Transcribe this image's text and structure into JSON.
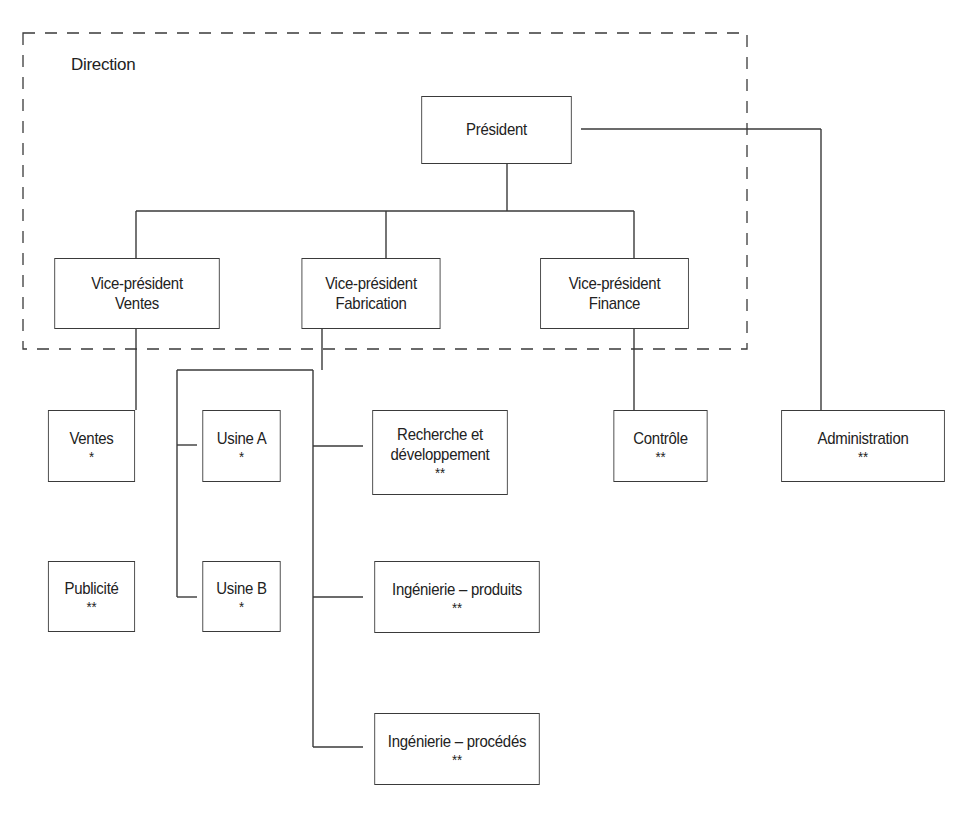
{
  "diagram": {
    "type": "org-chart",
    "group_label": "Direction",
    "nodes": {
      "president": {
        "title": "Président"
      },
      "vp_ventes": {
        "line1": "Vice-président",
        "line2": "Ventes"
      },
      "vp_fabrication": {
        "line1": "Vice-président",
        "line2": "Fabrication"
      },
      "vp_finance": {
        "line1": "Vice-président",
        "line2": "Finance"
      },
      "ventes": {
        "title": "Ventes",
        "marker": "*"
      },
      "publicite": {
        "title": "Publicité",
        "marker": "**"
      },
      "usine_a": {
        "title": "Usine A",
        "marker": "*"
      },
      "usine_b": {
        "title": "Usine B",
        "marker": "*"
      },
      "recherche": {
        "line1": "Recherche et",
        "line2": "développement",
        "marker": "**"
      },
      "ing_produits": {
        "title": "Ingénierie – produits",
        "marker": "**"
      },
      "ing_procedes": {
        "title": "Ingénierie – procédés",
        "marker": "**"
      },
      "controle": {
        "title": "Contrôle",
        "marker": "**"
      },
      "administration": {
        "title": "Administration",
        "marker": "**"
      }
    },
    "edges": [
      [
        "president",
        "vp_ventes"
      ],
      [
        "president",
        "vp_fabrication"
      ],
      [
        "president",
        "vp_finance"
      ],
      [
        "president",
        "administration"
      ],
      [
        "vp_ventes",
        "ventes"
      ],
      [
        "vp_fabrication",
        "usine_a"
      ],
      [
        "vp_fabrication",
        "usine_b"
      ],
      [
        "vp_fabrication",
        "recherche"
      ],
      [
        "vp_fabrication",
        "ing_produits"
      ],
      [
        "vp_fabrication",
        "ing_procedes"
      ],
      [
        "vp_finance",
        "controle"
      ]
    ]
  }
}
